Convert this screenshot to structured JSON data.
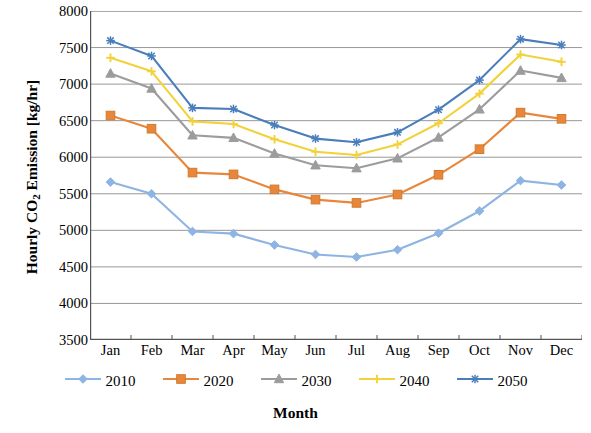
{
  "chart_data": {
    "type": "line",
    "title": "",
    "xlabel": "Month",
    "ylabel": "Hourly CO2 Emission [kg/hr]",
    "ylabel_prefix": "Hourly CO",
    "ylabel_sub": "2",
    "ylabel_suffix": " Emission [kg/hr]",
    "categories": [
      "Jan",
      "Feb",
      "Mar",
      "Apr",
      "May",
      "Jun",
      "Jul",
      "Aug",
      "Sep",
      "Oct",
      "Nov",
      "Dec"
    ],
    "ylim": [
      3500,
      8000
    ],
    "ytick_values": [
      3500,
      4000,
      4500,
      5000,
      5500,
      6000,
      6500,
      7000,
      7500,
      8000
    ],
    "ytick_labels": [
      "3500",
      "4000",
      "4500",
      "5000",
      "5500",
      "6000",
      "6500",
      "7000",
      "7500",
      "8000"
    ],
    "grid": "horizontal",
    "legend_position": "bottom",
    "series": [
      {
        "name": "2010",
        "color": "#8EB4E3",
        "marker": "diamond",
        "values": [
          5660,
          5500,
          4985,
          4955,
          4800,
          4670,
          4635,
          4735,
          4960,
          5265,
          5680,
          5620
        ]
      },
      {
        "name": "2020",
        "color": "#E8873C",
        "marker": "square",
        "values": [
          6570,
          6390,
          5790,
          5765,
          5560,
          5420,
          5375,
          5490,
          5760,
          6110,
          6610,
          6525
        ]
      },
      {
        "name": "2030",
        "color": "#9C9C9C",
        "marker": "triangle",
        "values": [
          7145,
          6940,
          6300,
          6265,
          6050,
          5890,
          5850,
          5985,
          6270,
          6655,
          7185,
          7085
        ]
      },
      {
        "name": "2040",
        "color": "#F2D23A",
        "marker": "cross",
        "values": [
          7360,
          7175,
          6490,
          6455,
          6245,
          6075,
          6030,
          6175,
          6465,
          6870,
          7405,
          7305
        ]
      },
      {
        "name": "2050",
        "color": "#4A7EBB",
        "marker": "asterisk",
        "values": [
          7595,
          7385,
          6675,
          6660,
          6440,
          6255,
          6205,
          6340,
          6650,
          7055,
          7615,
          7535
        ]
      }
    ]
  }
}
